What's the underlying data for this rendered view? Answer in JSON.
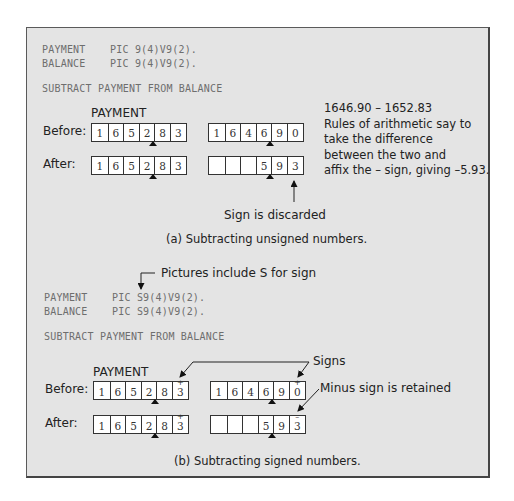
{
  "part_a": {
    "declarations": [
      {
        "name": "PAYMENT",
        "pic": "PIC 9(4)V9(2)."
      },
      {
        "name": "BALANCE",
        "pic": "PIC 9(4)V9(2)."
      }
    ],
    "statement": "SUBTRACT PAYMENT FROM BALANCE",
    "register_label": "PAYMENT",
    "before_label": "Before:",
    "after_label": "After:",
    "payment_before": [
      "1",
      "6",
      "5",
      "2",
      "8",
      "3"
    ],
    "balance_before": [
      "1",
      "6",
      "4",
      "6",
      "9",
      "0"
    ],
    "payment_after": [
      "1",
      "6",
      "5",
      "2",
      "8",
      "3"
    ],
    "balance_after": [
      "",
      "",
      "",
      "5",
      "9",
      "3"
    ],
    "note_lines": [
      "1646.90 – 1652.83",
      "Rules of arithmetic say to",
      "take the difference",
      "between the two and",
      "affix the – sign, giving –5.93."
    ],
    "annotation": "Sign is discarded",
    "caption": "(a) Subtracting unsigned numbers."
  },
  "part_b": {
    "pictures_note": "Pictures include S for sign",
    "declarations": [
      {
        "name": "PAYMENT",
        "pic": "PIC S9(4)V9(2)."
      },
      {
        "name": "BALANCE",
        "pic": "PIC S9(4)V9(2)."
      }
    ],
    "statement": "SUBTRACT PAYMENT FROM BALANCE",
    "register_label": "PAYMENT",
    "before_label": "Before:",
    "after_label": "After:",
    "payment_before": [
      {
        "d": "1"
      },
      {
        "d": "6"
      },
      {
        "d": "5"
      },
      {
        "d": "2"
      },
      {
        "d": "8"
      },
      {
        "d": "3",
        "s": "+"
      }
    ],
    "balance_before": [
      {
        "d": "1"
      },
      {
        "d": "6"
      },
      {
        "d": "4"
      },
      {
        "d": "6"
      },
      {
        "d": "9"
      },
      {
        "d": "0",
        "s": "+"
      }
    ],
    "payment_after": [
      {
        "d": "1"
      },
      {
        "d": "6"
      },
      {
        "d": "5"
      },
      {
        "d": "2"
      },
      {
        "d": "8"
      },
      {
        "d": "3",
        "s": "+"
      }
    ],
    "balance_after": [
      {
        "d": ""
      },
      {
        "d": ""
      },
      {
        "d": ""
      },
      {
        "d": "5"
      },
      {
        "d": "9"
      },
      {
        "d": "3",
        "s": "–"
      }
    ],
    "signs_label": "Signs",
    "minus_label": "Minus sign is retained",
    "caption": "(b) Subtracting signed numbers."
  }
}
